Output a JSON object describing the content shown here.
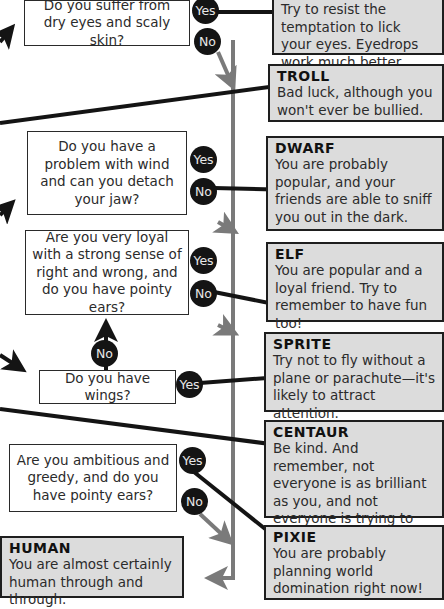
{
  "questions": {
    "dry_eyes": "Do you suffer from dry eyes and scaly skin?",
    "wind": "Do you have a problem with wind and can you detach your jaw?",
    "loyal": "Are you very loyal with a strong sense of right and wrong, and do you have pointy ears?",
    "wings": "Do you have wings?",
    "ambitious": "Are you ambitious and greedy, and do you have pointy ears?"
  },
  "answers": {
    "yes": "Yes",
    "no": "No"
  },
  "results": {
    "top": {
      "title": "",
      "text": "Try to resist the temptation to lick your eyes. Eyedrops work much better."
    },
    "troll": {
      "title": "TROLL",
      "text": "Bad luck, although you won't ever be bullied."
    },
    "dwarf": {
      "title": "DWARF",
      "text": "You are probably popular, and your friends are able to sniff you out in the dark."
    },
    "elf": {
      "title": "ELF",
      "text": "You are popular and a loyal friend. Try to remember to have fun too!"
    },
    "sprite": {
      "title": "SPRITE",
      "text": "Try not to fly without a plane or parachute—it's likely to attract attention."
    },
    "centaur": {
      "title": "CENTAUR",
      "text": "Be kind. And remember, not everyone is as brilliant as you, and not everyone is trying to copy your work."
    },
    "pixie": {
      "title": "PIXIE",
      "text": "You are probably planning world domination right now!"
    },
    "human": {
      "title": "HUMAN",
      "text": "You are almost certainly human through and through."
    }
  },
  "colors": {
    "result_bg": "#dcdcdc",
    "grey_line": "#7a7a7a",
    "black_line": "#141414",
    "bubble": "#141414"
  }
}
